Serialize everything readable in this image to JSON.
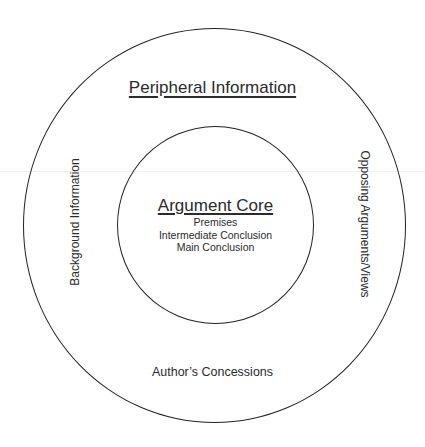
{
  "diagram": {
    "title": "Peripheral Information",
    "outer_ring": {
      "left_label": "Background Information",
      "right_label": "Opposing Arguments/Views",
      "bottom_label": "Author’s Concessions"
    },
    "core": {
      "title": "Argument Core",
      "items": [
        "Premises",
        "Intermediate Conclusion",
        "Main Conclusion"
      ]
    },
    "colors": {
      "stroke": "#222222",
      "text": "#2b2b2b",
      "background": "#ffffff"
    }
  }
}
